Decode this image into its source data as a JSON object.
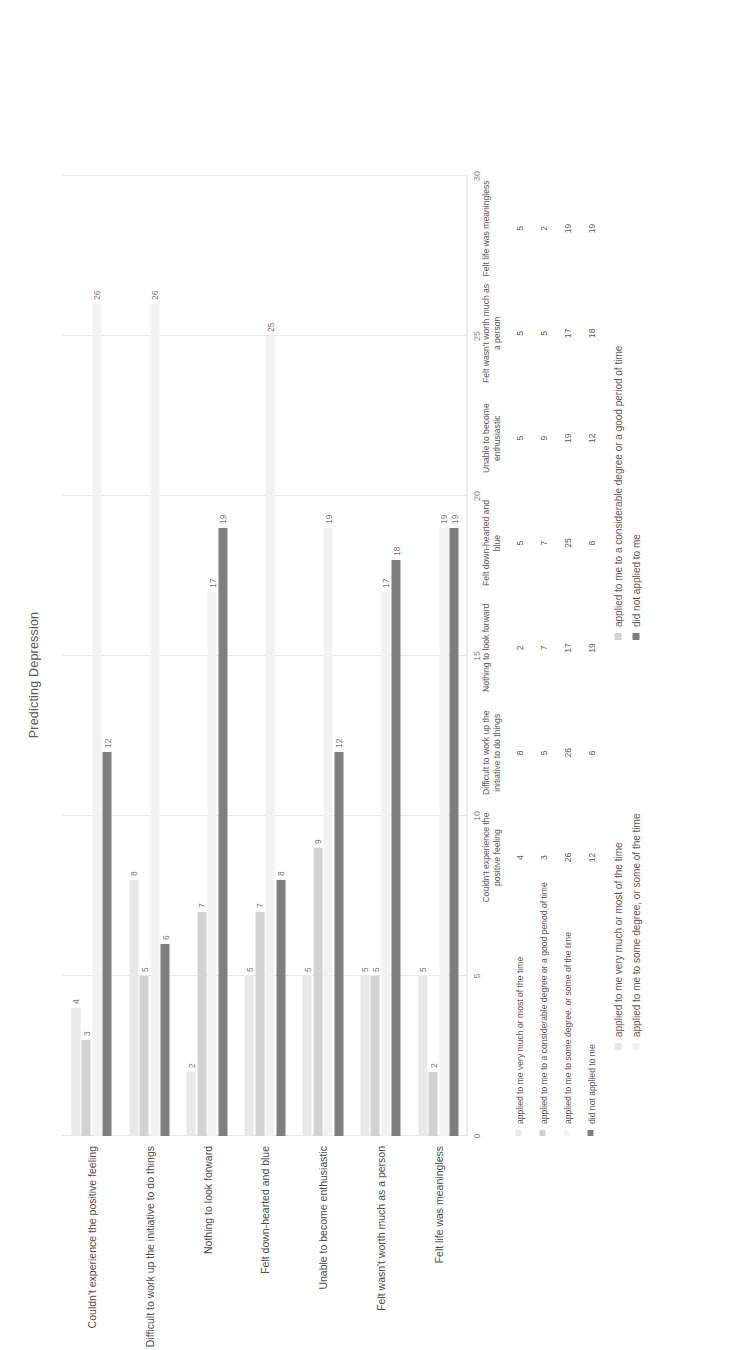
{
  "chart_data": {
    "type": "bar",
    "orientation": "horizontal",
    "title": "Predicting Depression",
    "xlabel": "",
    "ylabel": "",
    "xlim": [
      0,
      30
    ],
    "xticks": [
      "0",
      "5",
      "10",
      "15",
      "20",
      "25",
      "30"
    ],
    "grid": true,
    "legend_position": "bottom",
    "data_table_visible": true,
    "categories": [
      "Couldn't experience the positive feeling",
      "Difficult to work up the initiative to do things",
      "Nothing to look forward",
      "Felt down-hearted and blue",
      "Unable to become enthusiastic",
      "Felt wasn't worth much as a person",
      "Felt life was meaningless"
    ],
    "table_column_headers": [
      "Couldn't experience the positive feeling",
      "Difficult to work up the initiative to do things",
      "Nothing to look forward",
      "Felt down-hearted and blue",
      "Unable to become enthusiastic",
      "Felt wasn't worth much as a person",
      "Felt life was meaningless"
    ],
    "series": [
      {
        "name": "applied to me very much or most of the time",
        "color": "#e8e8e8",
        "values": [
          4,
          8,
          2,
          5,
          5,
          5,
          5
        ]
      },
      {
        "name": "applied to me to a considerable degree or a good period of time",
        "color": "#d2d2d2",
        "values": [
          3,
          5,
          7,
          7,
          9,
          5,
          2
        ]
      },
      {
        "name": "applied to me to some degree, or some of the time",
        "color": "#f2f2f2",
        "values": [
          26,
          26,
          17,
          25,
          19,
          17,
          19
        ]
      },
      {
        "name": "did not applied to me",
        "color": "#7f7f7f",
        "values": [
          12,
          6,
          19,
          8,
          12,
          18,
          19
        ]
      }
    ]
  },
  "legend": {
    "items": [
      {
        "label": "applied to me very much or most of the time",
        "color": "#e8e8e8"
      },
      {
        "label": "applied to me to a considerable degree or a good period of time",
        "color": "#d2d2d2"
      },
      {
        "label": "applied to me to some degree, or some of the time",
        "color": "#f2f2f2"
      },
      {
        "label": "did not applied to me",
        "color": "#7f7f7f"
      }
    ]
  }
}
